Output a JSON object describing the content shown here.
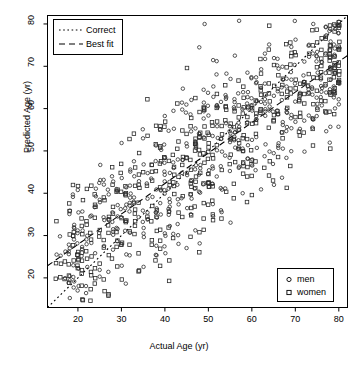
{
  "chart_data": {
    "type": "scatter",
    "title": "",
    "xlabel": "Actual Age (yr)",
    "ylabel": "Predicted Age (yr)",
    "xlim": [
      13,
      82
    ],
    "ylim": [
      13,
      82
    ],
    "xticks": [
      20,
      30,
      40,
      50,
      60,
      70,
      80
    ],
    "yticks": [
      20,
      30,
      40,
      50,
      60,
      70,
      80
    ],
    "grid": false,
    "series": [
      {
        "name": "men",
        "marker": "circle",
        "color": "#000000"
      },
      {
        "name": "women",
        "marker": "square",
        "color": "#000000"
      }
    ],
    "reference_lines": [
      {
        "name": "Correct",
        "style": "dotted",
        "slope": 1.0,
        "intercept": 0.0
      },
      {
        "name": "Best fit",
        "style": "dashed",
        "slope": 0.72,
        "intercept": 13.5
      }
    ]
  },
  "legend_lines": {
    "title": "",
    "entries": [
      {
        "label": "Correct",
        "style": "dotted"
      },
      {
        "label": "Best fit",
        "style": "dashed"
      }
    ]
  },
  "legend_groups": {
    "title": "",
    "entries": [
      {
        "label": "men",
        "marker": "circle"
      },
      {
        "label": "women",
        "marker": "square"
      }
    ]
  },
  "axes": {
    "x": {
      "label": "Actual Age (yr)",
      "ticks": [
        "20",
        "30",
        "40",
        "50",
        "60",
        "70",
        "80"
      ]
    },
    "y": {
      "label": "Predicted Age (yr)",
      "ticks": [
        "20",
        "30",
        "40",
        "50",
        "60",
        "70",
        "80"
      ]
    }
  },
  "colors": {
    "ink": "#000000",
    "background": "#ffffff"
  }
}
